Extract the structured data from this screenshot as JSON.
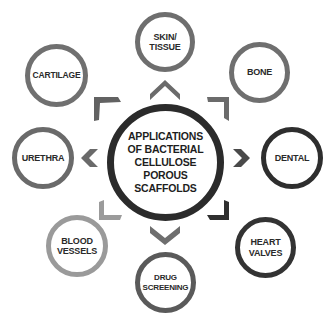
{
  "diagram": {
    "center": {
      "label": "APPLICATIONS\nOF BACTERIAL\nCELLULOSE\nPOROUS\nSCAFFOLDS",
      "ring_color": "#2b2b2b"
    },
    "nodes": [
      {
        "id": "skin-tissue",
        "label": "SKIN/\nTISSUE",
        "ring_color": "#6e6e6e"
      },
      {
        "id": "bone",
        "label": "BONE",
        "ring_color": "#6f6f6f"
      },
      {
        "id": "dental",
        "label": "DENTAL",
        "ring_color": "#2e2e2e"
      },
      {
        "id": "heart-valves",
        "label": "HEART\nVALVES",
        "ring_color": "#333333"
      },
      {
        "id": "drug-screening",
        "label": "DRUG\nSCREENING",
        "ring_color": "#5a5a5a"
      },
      {
        "id": "blood-vessels",
        "label": "BLOOD\nVESSELS",
        "ring_color": "#9a9a9a"
      },
      {
        "id": "urethra",
        "label": "URETHRA",
        "ring_color": "#6a6a6a"
      },
      {
        "id": "cartilage",
        "label": "CARTILAGE",
        "ring_color": "#707070"
      }
    ],
    "arrow_icons": [
      "chevron-up-icon",
      "chevron-up-right-icon",
      "chevron-right-icon",
      "chevron-down-right-icon",
      "chevron-down-icon",
      "chevron-down-left-icon",
      "chevron-left-icon",
      "chevron-up-left-icon"
    ]
  }
}
